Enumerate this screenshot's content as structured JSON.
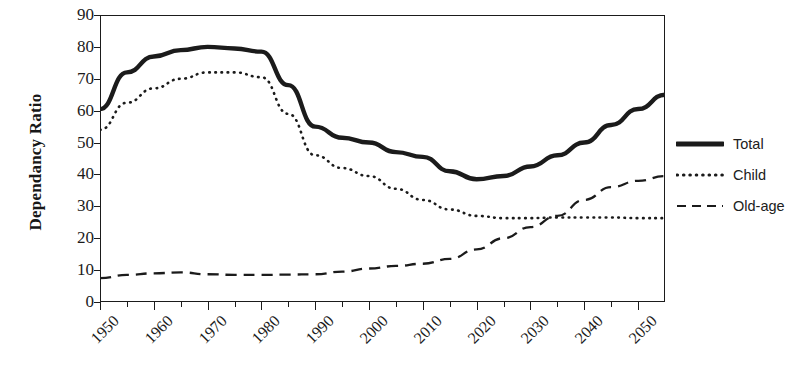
{
  "chart_data": {
    "type": "line",
    "title": "",
    "xlabel": "",
    "ylabel": "Dependancy Ratio",
    "xlim": [
      1950,
      2055
    ],
    "ylim": [
      0,
      90
    ],
    "grid": false,
    "legend_position": "right",
    "x_tick_labels": [
      "1950",
      "1960",
      "1970",
      "1980",
      "1990",
      "2000",
      "2010",
      "2020",
      "2030",
      "2040",
      "2050"
    ],
    "x_major_ticks": [
      1950,
      1960,
      1970,
      1980,
      1990,
      2000,
      2010,
      2020,
      2030,
      2040,
      2050
    ],
    "x_minor_ticks": [
      1955,
      1965,
      1975,
      1985,
      1995,
      2005,
      2015,
      2025,
      2035,
      2045
    ],
    "y_tick_labels": [
      "0",
      "10",
      "20",
      "30",
      "40",
      "50",
      "60",
      "70",
      "80",
      "90"
    ],
    "y_ticks": [
      0,
      10,
      20,
      30,
      40,
      50,
      60,
      70,
      80,
      90
    ],
    "x": [
      1950,
      1955,
      1960,
      1965,
      1970,
      1975,
      1980,
      1985,
      1990,
      1995,
      2000,
      2005,
      2010,
      2015,
      2020,
      2025,
      2030,
      2035,
      2040,
      2045,
      2050,
      2055
    ],
    "series": [
      {
        "name": "Total",
        "style": "solid-thick",
        "color": "#1b1b1b",
        "values": [
          60.5,
          72.0,
          77.0,
          79.0,
          80.0,
          79.5,
          78.5,
          68.0,
          55.0,
          51.5,
          50.0,
          47.0,
          45.5,
          41.0,
          38.5,
          39.5,
          42.5,
          46.0,
          50.0,
          55.5,
          60.5,
          65.0
        ]
      },
      {
        "name": "Child",
        "style": "dotted",
        "color": "#1b1b1b",
        "values": [
          54.0,
          62.5,
          67.0,
          70.0,
          72.0,
          72.0,
          70.5,
          59.0,
          46.0,
          42.0,
          39.5,
          35.5,
          32.0,
          29.0,
          27.0,
          26.3,
          26.3,
          26.5,
          26.5,
          26.5,
          26.3,
          26.3
        ]
      },
      {
        "name": "Old-age",
        "style": "dashed",
        "color": "#1b1b1b",
        "values": [
          7.5,
          8.5,
          9.0,
          9.3,
          8.7,
          8.5,
          8.5,
          8.6,
          8.7,
          9.5,
          10.5,
          11.3,
          12.0,
          13.5,
          16.5,
          20.0,
          23.5,
          27.0,
          32.0,
          36.0,
          38.0,
          39.5
        ]
      }
    ]
  },
  "legend": {
    "items": [
      {
        "label": "Total",
        "style": "solid-thick"
      },
      {
        "label": "Child",
        "style": "dotted"
      },
      {
        "label": "Old-age",
        "style": "dashed"
      }
    ]
  }
}
